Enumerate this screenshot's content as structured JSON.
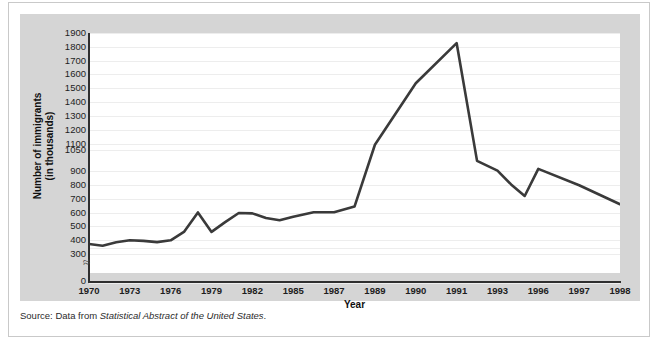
{
  "figure": {
    "cut_off_text": "",
    "source_prefix": "Source: Data from ",
    "source_italic": "Statistical Abstract of the United States",
    "source_suffix": "."
  },
  "colors": {
    "line": "#3a3a3a",
    "axis": "#2f2f2f",
    "grid": "#ededed",
    "mat": "#d5d5d5",
    "plot_background": "#ffffff",
    "card_border": "#c9c9c9"
  },
  "chart_data": {
    "type": "line",
    "title": "",
    "xlabel": "Year",
    "ylabel": "Number of immigrants (in thousands)",
    "ylabel_line1": "Number of immigrants",
    "ylabel_line2": "(in thousands)",
    "grid": true,
    "legend": "none",
    "axis_break": "≈",
    "axis_break_note": "y-axis broken between 0 and 300",
    "y_ticks": [
      0,
      300,
      400,
      500,
      600,
      700,
      800,
      900,
      1050,
      1100,
      1200,
      1300,
      1400,
      1500,
      1600,
      1700,
      1800,
      1900
    ],
    "y_tick_labels": [
      "0",
      "300",
      "400",
      "500",
      "600",
      "700",
      "800",
      "900",
      "1050",
      "1100",
      "1200",
      "1300",
      "1400",
      "1500",
      "1600",
      "1700",
      "1800",
      "1900"
    ],
    "x_tick_labels": [
      "1970",
      "1973",
      "1976",
      "1979",
      "1982",
      "1985",
      "1987",
      "1989",
      "1990",
      "1991",
      "1993",
      "1996",
      "1997",
      "1998"
    ],
    "ylim": [
      300,
      1900
    ],
    "xlim": [
      1970,
      1998
    ],
    "x": [
      1970,
      1971,
      1972,
      1973,
      1974,
      1975,
      1976,
      1977,
      1978,
      1979,
      1980,
      1981,
      1982,
      1983,
      1984,
      1985,
      1986,
      1987,
      1988,
      1989,
      1990,
      1991,
      1992,
      1993,
      1994,
      1995,
      1996,
      1997,
      1998
    ],
    "values": [
      373,
      360,
      385,
      400,
      395,
      386,
      399,
      462,
      601,
      460,
      531,
      597,
      594,
      560,
      544,
      570,
      602,
      602,
      643,
      1091,
      1536,
      1827,
      974,
      904,
      804,
      720,
      916,
      798,
      660
    ],
    "series": [
      {
        "name": "Number of immigrants (in thousands)",
        "values": [
          373,
          360,
          385,
          400,
          395,
          386,
          399,
          462,
          601,
          460,
          531,
          597,
          594,
          560,
          544,
          570,
          602,
          602,
          643,
          1091,
          1536,
          1827,
          974,
          904,
          804,
          720,
          916,
          798,
          660
        ]
      }
    ],
    "annotations": []
  }
}
